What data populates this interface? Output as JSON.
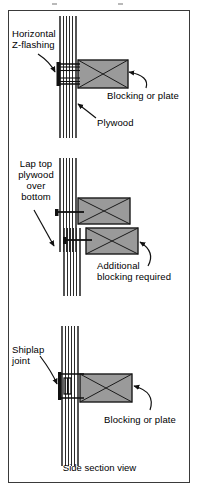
{
  "figure": {
    "caption": "Side section view",
    "colors": {
      "blocking_fill": "#9a9a9a",
      "blocking_stroke": "#1a1a1a",
      "plywood_line": "#2b2b2b",
      "flashing": "#1a1a1a",
      "frame_border": "#3a3a3a",
      "background": "#ffffff"
    }
  },
  "panels": [
    {
      "id": "z-flashing",
      "labels": {
        "left": "Horizontal\nZ-flashing",
        "lower": "Plywood",
        "right": "Blocking or plate"
      },
      "components": [
        "plywood",
        "z-flashing",
        "blocking"
      ]
    },
    {
      "id": "lapped-plywood",
      "labels": {
        "left": "Lap top\nplywood\nover\nbottom",
        "right": "Additional\nblocking required"
      },
      "components": [
        "plywood-upper",
        "plywood-lower",
        "blocking-upper",
        "blocking-lower"
      ]
    },
    {
      "id": "shiplap",
      "labels": {
        "left": "Shiplap\njoint",
        "right": "Blocking or plate"
      },
      "components": [
        "plywood",
        "shiplap-joint",
        "blocking"
      ]
    }
  ]
}
